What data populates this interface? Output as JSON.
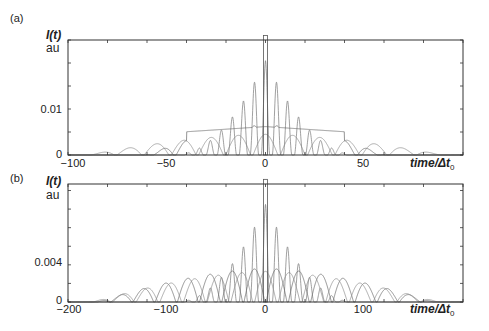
{
  "chart_data": [
    {
      "panel": "(a)",
      "type": "line",
      "title": "",
      "ylabel": "I(t)",
      "yunit": "au",
      "xlabel": "time/Δt0",
      "xlim": [
        -100,
        100
      ],
      "ylim": [
        0,
        0.025
      ],
      "xticks": [
        -100,
        -50,
        0,
        50
      ],
      "xtick_labels": [
        "−100",
        "−50",
        "0",
        "50"
      ],
      "yticks": [
        0,
        0.01
      ],
      "ytick_labels": [
        "0",
        "0.01"
      ],
      "minor_ytick_step": 0.005,
      "minor_xtick_step": 20,
      "grid": false,
      "series": [
        {
          "name": "narrow-peak train",
          "peak_spacing": 5.6,
          "peak_width": 2.2,
          "envelope_halfwidth": 46,
          "max": 0.0205
        },
        {
          "name": "medium lobes",
          "lobe_spacing": 11.5,
          "lobe_width": 10,
          "envelope_halfwidth": 60,
          "max": 0.0065,
          "plateau_until": 40
        },
        {
          "name": "wide lobes",
          "lobe_spacing": 13.8,
          "lobe_width": 12.5,
          "envelope_halfwidth": 90,
          "max": 0.0045
        }
      ],
      "center_marker": {
        "x": 0,
        "width": 2,
        "height": 0.026
      }
    },
    {
      "panel": "(b)",
      "type": "line",
      "title": "",
      "ylabel": "I(t)",
      "yunit": "au",
      "xlabel": "time/Δt0",
      "xlim": [
        -200,
        200
      ],
      "ylim": [
        0,
        0.0127
      ],
      "xticks": [
        -200,
        -100,
        0,
        100
      ],
      "xtick_labels": [
        "−200",
        "−100",
        "0",
        "100"
      ],
      "yticks": [
        0,
        0.004
      ],
      "ytick_labels": [
        "0",
        "0.004"
      ],
      "minor_ytick_step": 0.002,
      "minor_xtick_step": 40,
      "grid": false,
      "series": [
        {
          "name": "narrow-peak train",
          "peak_spacing": 11.2,
          "peak_width": 4.4,
          "envelope_halfwidth": 90,
          "max": 0.0105
        },
        {
          "name": "medium lobes",
          "lobe_spacing": 22.5,
          "lobe_width": 21,
          "envelope_halfwidth": 170,
          "max": 0.0036
        },
        {
          "name": "wide lobes",
          "lobe_spacing": 24,
          "lobe_width": 22,
          "envelope_halfwidth": 175,
          "max": 0.0033
        }
      ],
      "center_marker": {
        "x": 0,
        "width": 4,
        "height": 0.0132
      }
    }
  ],
  "panels": {
    "a": {
      "label": "(a)",
      "ylabel": "I(t)",
      "yunit": "au",
      "ytick_0": "0",
      "ytick_1": "0.01",
      "xtick_0": "−100",
      "xtick_1": "−50",
      "xtick_2": "0",
      "xtick_3": "50",
      "xlabel": "time/Δt",
      "xlabel_sub": "0"
    },
    "b": {
      "label": "(b)",
      "ylabel": "I(t)",
      "yunit": "au",
      "ytick_0": "0",
      "ytick_1": "0.004",
      "xtick_0": "−200",
      "xtick_1": "−100",
      "xtick_2": "0",
      "xtick_3": "100",
      "xlabel": "time/Δt",
      "xlabel_sub": "0"
    }
  }
}
